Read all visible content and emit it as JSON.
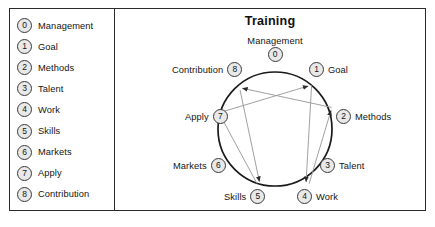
{
  "legend": {
    "name": "index-legend",
    "items": [
      {
        "index": "0",
        "label": "Management"
      },
      {
        "index": "1",
        "label": "Goal"
      },
      {
        "index": "2",
        "label": "Methods"
      },
      {
        "index": "3",
        "label": "Talent"
      },
      {
        "index": "4",
        "label": "Work"
      },
      {
        "index": "5",
        "label": "Skills"
      },
      {
        "index": "6",
        "label": "Markets"
      },
      {
        "index": "7",
        "label": "Apply"
      },
      {
        "index": "8",
        "label": "Contribution"
      }
    ]
  },
  "diagram": {
    "title": "Training",
    "nodes": [
      {
        "index": "0",
        "label": "Management",
        "position": "top"
      },
      {
        "index": "1",
        "label": "Goal",
        "position": "upper-right"
      },
      {
        "index": "2",
        "label": "Methods",
        "position": "right"
      },
      {
        "index": "3",
        "label": "Talent",
        "position": "lower-right"
      },
      {
        "index": "4",
        "label": "Work",
        "position": "bottom-right"
      },
      {
        "index": "5",
        "label": "Skills",
        "position": "bottom-left"
      },
      {
        "index": "6",
        "label": "Markets",
        "position": "left"
      },
      {
        "index": "7",
        "label": "Apply",
        "position": "upper-left"
      },
      {
        "index": "8",
        "label": "Contribution",
        "position": "top-left"
      }
    ],
    "edges": [
      {
        "from": "1",
        "to": "4"
      },
      {
        "from": "4",
        "to": "2"
      },
      {
        "from": "2",
        "to": "8"
      },
      {
        "from": "8",
        "to": "5"
      },
      {
        "from": "5",
        "to": "7"
      },
      {
        "from": "7",
        "to": "1"
      }
    ]
  },
  "colors": {
    "frame": "#2b2b2b",
    "badge_fill": "#e9e9e9",
    "badge_stroke": "#3a3a3a",
    "ring": "#1a1a1a",
    "edge": "#9b9b9b",
    "text": "#141414",
    "background": "#ffffff"
  }
}
